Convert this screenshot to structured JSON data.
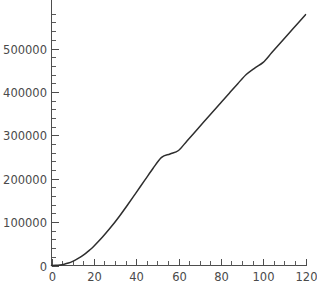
{
  "chart_data": {
    "type": "line",
    "title": "",
    "subtitle": "",
    "xlabel": "",
    "ylabel": "",
    "xlim": [
      0,
      120
    ],
    "ylim": [
      0,
      580000
    ],
    "grid": false,
    "legend": null,
    "legend_position": "none",
    "x_major_ticks": [
      0,
      20,
      40,
      60,
      80,
      100,
      120
    ],
    "x_tick_labels": [
      "0",
      "20",
      "40",
      "60",
      "80",
      "100",
      "120"
    ],
    "x_minor_tick_step": 5,
    "y_major_ticks": [
      0,
      100000,
      200000,
      300000,
      400000,
      500000
    ],
    "y_tick_labels": [
      "0",
      "100000",
      "200000",
      "300000",
      "400000",
      "500000"
    ],
    "y_minor_tick_step": 20000,
    "series": [
      {
        "name": "curve",
        "color": "#2e2e2e",
        "x": [
          0,
          2,
          4,
          6,
          8,
          10,
          12,
          14,
          16,
          18,
          20,
          24,
          28,
          32,
          36,
          40,
          44,
          48,
          52,
          56,
          60,
          64,
          68,
          72,
          76,
          80,
          84,
          88,
          92,
          96,
          100,
          104,
          108,
          112,
          116,
          120
        ],
        "values": [
          0,
          300,
          1200,
          2900,
          5600,
          9500,
          14500,
          20500,
          27500,
          35500,
          44500,
          65000,
          88000,
          113000,
          140000,
          168000,
          196000,
          224000,
          249000,
          257000,
          265000,
          287000,
          309000,
          331000,
          353000,
          375000,
          397000,
          419000,
          440000,
          455000,
          468000,
          490000,
          512000,
          534000,
          556000,
          578000
        ]
      }
    ]
  },
  "axes": {
    "y_axis_name": "y-axis",
    "x_axis_name": "x-axis"
  },
  "caption": {
    "text": ""
  },
  "colors": {
    "background": "#ffffff",
    "axis": "#4d4d4d",
    "curve": "#2e2e2e",
    "text": "#4a4a4a"
  }
}
